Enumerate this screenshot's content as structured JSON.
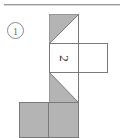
{
  "figure": {
    "item_label": "1",
    "glyph": "2",
    "glyph_rotation_degrees": 90,
    "caption_rule_visible": true,
    "colors": {
      "shade": "#b4b4b4",
      "stroke": "#7a7a7a",
      "rule": "#9a9a9a",
      "number_ink": "#6f6f6f",
      "glyph_ink": "#2b2b2b",
      "background": "#ffffff"
    },
    "faces": [
      {
        "name": "top-face",
        "column": 2,
        "row": 1,
        "fill": "half-shaded",
        "shaded_half": "upper-left",
        "diagonal": "bottom-left-to-top-right"
      },
      {
        "name": "middle-left-face",
        "column": 2,
        "row": 2,
        "fill": "white",
        "mark": "2"
      },
      {
        "name": "middle-right-face",
        "column": 3,
        "row": 2,
        "fill": "white",
        "mark": ""
      },
      {
        "name": "lower-face",
        "column": 2,
        "row": 3,
        "fill": "half-shaded",
        "shaded_half": "lower-left",
        "diagonal": "top-left-to-bottom-right"
      },
      {
        "name": "bottom-left-face",
        "column": 1,
        "row": 4,
        "fill": "shaded"
      },
      {
        "name": "bottom-right-face",
        "column": 2,
        "row": 4,
        "fill": "shaded"
      }
    ]
  }
}
